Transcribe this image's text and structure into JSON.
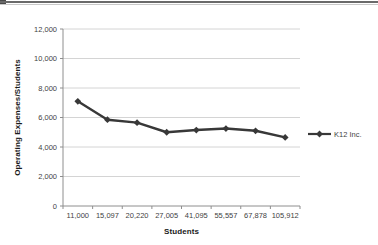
{
  "page": {
    "background": "#ffffff",
    "top_border": {
      "dark_line_color": "#6a6a6a",
      "light_line_color": "#c9c9c9"
    }
  },
  "chart_data": {
    "type": "line",
    "title": "",
    "xlabel": "Students",
    "ylabel": "Operating Expenses/Students",
    "categories": [
      "11,000",
      "15,097",
      "20,220",
      "27,005",
      "41,095",
      "55,557",
      "67,878",
      "105,912"
    ],
    "series": [
      {
        "name": "K12 Inc.",
        "color": "#383838",
        "marker": "diamond",
        "values": [
          7100,
          5850,
          5650,
          5000,
          5150,
          5250,
          5100,
          4650
        ]
      }
    ],
    "ylim": [
      0,
      12000
    ],
    "ytick_step": 2000,
    "ytick_labels": [
      "0",
      "2,000",
      "4,000",
      "6,000",
      "8,000",
      "10,000",
      "12,000"
    ],
    "grid": "horizontal",
    "gridline_color": "#d4d4d4",
    "axis_color": "#8e8e8e",
    "tick_label_color": "#3f3f3f",
    "legend_position": "right"
  }
}
